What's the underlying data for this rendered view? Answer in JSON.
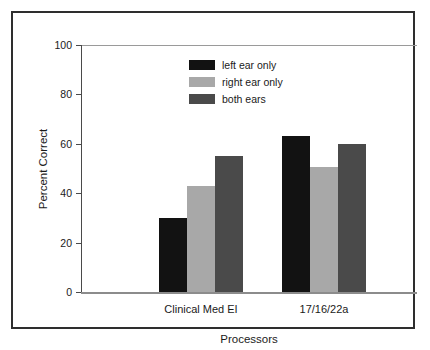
{
  "chart_data": {
    "type": "bar",
    "title": "",
    "xlabel": "Processors",
    "ylabel": "Percent Correct",
    "categories": [
      "Clinical Med EI",
      "17/16/22a"
    ],
    "yticks": [
      0,
      20,
      40,
      60,
      80,
      100
    ],
    "ylim": [
      0,
      100
    ],
    "grid": false,
    "legend_position": "upper center",
    "series": [
      {
        "name": "left ear only",
        "color": "#121212",
        "values": [
          30,
          63
        ]
      },
      {
        "name": "right ear only",
        "color": "#a8a8a8",
        "values": [
          43,
          50.5
        ]
      },
      {
        "name": "both ears",
        "color": "#4a4a4a",
        "values": [
          55,
          60
        ]
      }
    ]
  }
}
